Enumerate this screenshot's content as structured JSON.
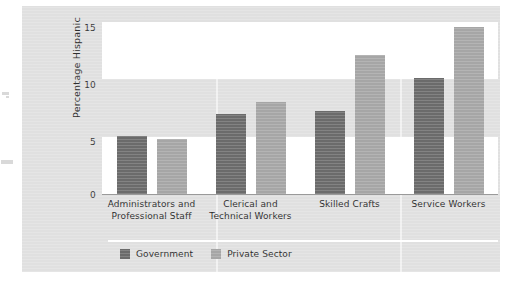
{
  "chart_data": {
    "type": "bar",
    "title": "",
    "xlabel": "",
    "ylabel": "Percentage Hispanic",
    "ylim": [
      0,
      15
    ],
    "yticks": [
      "0",
      "5",
      "10",
      "15"
    ],
    "grid": "horizontal-bands",
    "legend_position": "bottom-left",
    "categories": [
      "Administrators and Professional Staff",
      "Clerical and Technical Workers",
      "Skilled Crafts",
      "Service Workers"
    ],
    "category_lines": [
      [
        "Administrators and",
        "Professional Staff"
      ],
      [
        "Clerical and",
        "Technical Workers"
      ],
      [
        "Skilled Crafts",
        ""
      ],
      [
        "Service Workers",
        ""
      ]
    ],
    "series": [
      {
        "name": "Government",
        "color": "#6b6b6b",
        "values": [
          5.1,
          7.0,
          7.2,
          10.1
        ]
      },
      {
        "name": "Private Sector",
        "color": "#a6a6a6",
        "values": [
          4.8,
          8.0,
          12.1,
          14.6
        ]
      }
    ]
  },
  "colors": {
    "panel_background": "#e0e0e0",
    "band_light": "#ffffff",
    "band_gray": "#e0e0e0",
    "axis": "#9a9a9a",
    "government": "#6b6b6b",
    "private_sector": "#a6a6a6"
  }
}
